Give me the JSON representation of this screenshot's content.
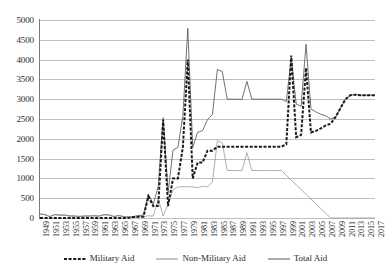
{
  "chart_data": {
    "type": "line",
    "title": "",
    "subtitle": "",
    "xlabel": "",
    "ylabel": "",
    "xlim": [
      1949,
      2017
    ],
    "ylim": [
      0,
      5000
    ],
    "ytick_step": 500,
    "grid": true,
    "legend_position": "bottom",
    "yticks": [
      "0",
      "500",
      "1000",
      "1500",
      "2000",
      "2500",
      "3000",
      "3500",
      "4000",
      "4500",
      "5000"
    ],
    "x": [
      1949,
      1950,
      1951,
      1952,
      1953,
      1954,
      1955,
      1956,
      1957,
      1958,
      1959,
      1960,
      1961,
      1962,
      1963,
      1964,
      1965,
      1966,
      1967,
      1968,
      1969,
      1970,
      1971,
      1972,
      1973,
      1974,
      1975,
      1976,
      1977,
      1978,
      1979,
      1980,
      1981,
      1982,
      1983,
      1984,
      1985,
      1986,
      1987,
      1988,
      1989,
      1990,
      1991,
      1992,
      1993,
      1994,
      1995,
      1996,
      1997,
      1998,
      1999,
      2000,
      2001,
      2002,
      2003,
      2004,
      2005,
      2006,
      2007,
      2008,
      2009,
      2010,
      2011,
      2012,
      2013,
      2014,
      2015,
      2016,
      2017
    ],
    "xticks": [
      "1949",
      "1951",
      "1953",
      "1955",
      "1957",
      "1959",
      "1961",
      "1963",
      "1965",
      "1967",
      "1969",
      "1971",
      "1973",
      "1975",
      "1977",
      "1979",
      "1981",
      "1983",
      "1985",
      "1987",
      "1989",
      "1991",
      "1993",
      "1995",
      "1997",
      "1999",
      "2001",
      "2003",
      "2005",
      "2007",
      "2009",
      "2011",
      "2013",
      "2015",
      "2017"
    ],
    "colors": {
      "military_aid": "#1a1a1a",
      "non_military_aid": "#8c8c8c",
      "total_aid": "#595959",
      "gridline": "#bfbfbf",
      "axis": "#7a7a7a",
      "background": "#ffffff"
    },
    "series": [
      {
        "name": "Military Aid",
        "style": "dashed",
        "values": [
          0,
          0,
          0,
          0,
          0,
          0,
          0,
          0,
          0,
          0,
          0,
          0,
          0,
          0,
          0,
          0,
          0,
          0,
          7,
          25,
          30,
          30,
          545,
          300,
          307,
          2482,
          300,
          1000,
          1000,
          1790,
          4000,
          1000,
          1400,
          1400,
          1700,
          1700,
          1800,
          1800,
          1800,
          1800,
          1800,
          1800,
          1800,
          1800,
          1800,
          1800,
          1800,
          1800,
          1800,
          1800,
          1860,
          4100,
          2040,
          2100,
          3790,
          2160,
          2200,
          2260,
          2340,
          2380,
          2550,
          2775,
          3000,
          3100,
          3115,
          3100,
          3100,
          3100,
          3100
        ]
      },
      {
        "name": "Non-Military Aid",
        "style": "solid-thin",
        "values": [
          100,
          86,
          35,
          86,
          73,
          74,
          52,
          50,
          40,
          49,
          50,
          56,
          48,
          83,
          77,
          37,
          62,
          36,
          13,
          13,
          36,
          40,
          55,
          50,
          492,
          51,
          344,
          712,
          785,
          792,
          790,
          786,
          764,
          806,
          785,
          910,
          1950,
          1898,
          1200,
          1200,
          1200,
          1194,
          1650,
          1200,
          1200,
          1200,
          1200,
          1200,
          1200,
          1200,
          1080,
          949,
          838,
          720,
          596,
          478,
          360,
          240,
          120,
          0,
          0,
          0,
          0,
          0,
          0,
          0,
          0,
          0,
          0
        ]
      },
      {
        "name": "Total Aid",
        "style": "solid",
        "values": [
          100,
          86,
          35,
          86,
          73,
          74,
          52,
          50,
          40,
          49,
          50,
          56,
          48,
          83,
          77,
          37,
          62,
          36,
          20,
          38,
          66,
          70,
          600,
          350,
          799,
          2533,
          644,
          1712,
          1785,
          2582,
          4790,
          1786,
          2164,
          2206,
          2485,
          2610,
          3750,
          3698,
          3000,
          3000,
          3000,
          2994,
          3450,
          3000,
          3000,
          3000,
          3000,
          3000,
          3000,
          3000,
          2940,
          4049,
          2878,
          2820,
          4386,
          2756,
          2678,
          2620,
          2580,
          2500,
          2550,
          2775,
          3000,
          3100,
          3115,
          3100,
          3100,
          3100,
          3100
        ]
      }
    ]
  },
  "legend": {
    "items": [
      {
        "label": "Military Aid",
        "key": "military_aid"
      },
      {
        "label": "Non-Military Aid",
        "key": "non_military_aid"
      },
      {
        "label": "Total Aid",
        "key": "total_aid"
      }
    ]
  }
}
